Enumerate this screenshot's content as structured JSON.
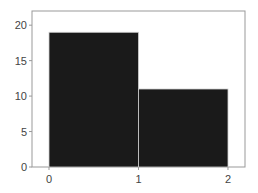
{
  "chart_data": {
    "type": "bar",
    "subtype": "histogram",
    "title": "",
    "xlabel": "",
    "ylabel": "",
    "bins": [
      {
        "x0": 0,
        "x1": 1,
        "value": 19
      },
      {
        "x0": 1,
        "x1": 2,
        "value": 11
      }
    ],
    "categories": [
      "0-1",
      "1-2"
    ],
    "values": [
      19,
      11
    ],
    "xlim": [
      -0.19,
      2.19
    ],
    "ylim": [
      0,
      22
    ],
    "xticks": [
      0,
      1,
      2
    ],
    "yticks": [
      0,
      5,
      10,
      15,
      20
    ],
    "grid": false,
    "legend": null,
    "bar_color": "#1a1a1a",
    "bar_edge_color": "#d0d0d0",
    "axis_color": "#999999",
    "tick_label_color": "#444444"
  }
}
